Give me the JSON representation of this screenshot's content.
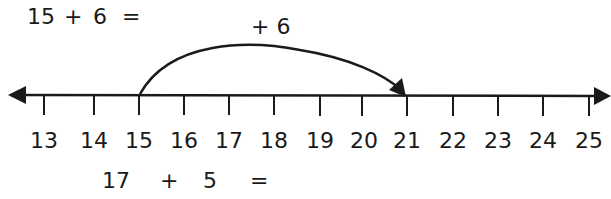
{
  "problem_top": {
    "a": "15",
    "op": "+",
    "b": "6",
    "eq": "="
  },
  "jump": {
    "label": "+ 6",
    "from": 15,
    "to": 21
  },
  "number_line": {
    "min": 13,
    "max": 25,
    "ticks": [
      "13",
      "14",
      "15",
      "16",
      "17",
      "18",
      "19",
      "20",
      "21",
      "22",
      "23",
      "24",
      "25"
    ],
    "arrows": "both"
  },
  "problem_bottom": {
    "a": "17",
    "op": "+",
    "b": "5",
    "eq": "="
  },
  "colors": {
    "ink": "#1a1a1a",
    "background": "#ffffff"
  }
}
